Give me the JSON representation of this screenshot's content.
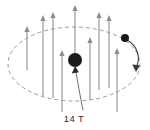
{
  "figure": {
    "kind": "physics-field-diagram",
    "width": 150,
    "height": 130,
    "background_color": "#ffffff",
    "field_label": "14 T",
    "label_color": "#2b2b2b",
    "orbit_color": "#9a9a9a",
    "arrow_color": "#8c8c8c",
    "dot_color": "#1a1a1a",
    "direction_arrow_color": "#3a3a3a"
  },
  "chart_data": {
    "type": "diagram",
    "title": "",
    "subtitle": "",
    "xlabel": "",
    "ylabel": "",
    "annotations": [
      {
        "name": "field-strength",
        "text": "14 T",
        "x": 86,
        "y": 120,
        "points_to_x": 75,
        "points_to_y": 64
      }
    ],
    "orbit": {
      "shape": "ellipse",
      "center_x": 74,
      "center_y": 64,
      "radius_x": 66,
      "radius_y": 37,
      "dashed": true,
      "direction": "clockwise-viewed-from-above"
    },
    "nucleus": {
      "x": 75,
      "y": 60,
      "radius": 7
    },
    "orbiting_particle": {
      "x": 125,
      "y": 38,
      "radius": 4
    },
    "field_arrows": [
      {
        "x": 27,
        "y_tip": 26,
        "y_tail": 70
      },
      {
        "x": 43,
        "y_tip": 15,
        "y_tail": 96
      },
      {
        "x": 53,
        "y_tip": 12,
        "y_tail": 98
      },
      {
        "x": 62,
        "y_tip": 50,
        "y_tail": 112
      },
      {
        "x": 75,
        "y_tip": 5,
        "y_tail": 58
      },
      {
        "x": 90,
        "y_tip": 37,
        "y_tail": 100
      },
      {
        "x": 99,
        "y_tip": 12,
        "y_tail": 90
      },
      {
        "x": 109,
        "y_tip": 15,
        "y_tail": 88
      },
      {
        "x": 117,
        "y_tip": 48,
        "y_tail": 112
      }
    ],
    "legend": [],
    "grid": false
  }
}
